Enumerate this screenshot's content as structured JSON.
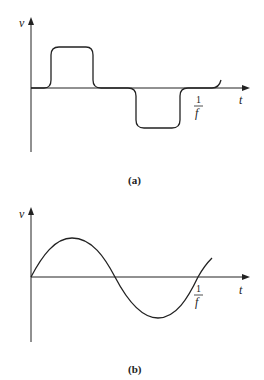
{
  "figure_a": {
    "y_label": "v",
    "x_label": "t",
    "period_label_num": "1",
    "period_label_den": "f",
    "caption": "(a)",
    "waveform": "square-like pulse wave (rounded corners)"
  },
  "figure_b": {
    "y_label": "v",
    "x_label": "t",
    "period_label_num": "1",
    "period_label_den": "f",
    "caption": "(b)",
    "waveform": "sine wave"
  },
  "colors": {
    "stroke": "#222222",
    "background": "#ffffff"
  }
}
